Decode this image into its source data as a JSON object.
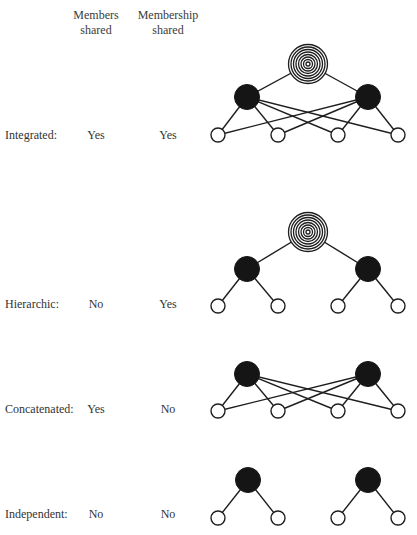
{
  "headers": {
    "members_shared": [
      "Members",
      "shared"
    ],
    "membership_shared": [
      "Membership",
      "shared"
    ]
  },
  "rows": [
    {
      "label": "Integrated:",
      "members_shared": "Yes",
      "membership_shared": "Yes"
    },
    {
      "label": "Hierarchic:",
      "members_shared": "No",
      "membership_shared": "Yes"
    },
    {
      "label": "Concatenated:",
      "members_shared": "Yes",
      "membership_shared": "No"
    },
    {
      "label": "Independent:",
      "members_shared": "No",
      "membership_shared": "No"
    }
  ],
  "diagrams": [
    {
      "name": "integrated",
      "has_top_node": true,
      "top_node": {
        "x": 308,
        "y": 64,
        "r": 20
      },
      "group_nodes": [
        {
          "x": 247,
          "y": 97
        },
        {
          "x": 368,
          "y": 97
        }
      ],
      "leaf_nodes": [
        {
          "x": 218,
          "y": 135
        },
        {
          "x": 278,
          "y": 135
        },
        {
          "x": 338,
          "y": 135
        },
        {
          "x": 398,
          "y": 135
        }
      ],
      "edges": "each group node connects to all four leaf nodes"
    },
    {
      "name": "hierarchic",
      "has_top_node": true,
      "top_node": {
        "x": 308,
        "y": 232,
        "r": 20
      },
      "group_nodes": [
        {
          "x": 247,
          "y": 269
        },
        {
          "x": 368,
          "y": 269
        }
      ],
      "leaf_nodes": [
        {
          "x": 218,
          "y": 306
        },
        {
          "x": 278,
          "y": 306
        },
        {
          "x": 338,
          "y": 306
        },
        {
          "x": 398,
          "y": 306
        }
      ],
      "edges": "each group node connects only to its own two leaf nodes"
    },
    {
      "name": "concatenated",
      "has_top_node": false,
      "group_nodes": [
        {
          "x": 247,
          "y": 374
        },
        {
          "x": 368,
          "y": 374
        }
      ],
      "leaf_nodes": [
        {
          "x": 218,
          "y": 411
        },
        {
          "x": 278,
          "y": 411
        },
        {
          "x": 338,
          "y": 411
        },
        {
          "x": 398,
          "y": 411
        }
      ],
      "edges": "each group node connects to all four leaf nodes"
    },
    {
      "name": "independent",
      "has_top_node": false,
      "group_nodes": [
        {
          "x": 248,
          "y": 480
        },
        {
          "x": 368,
          "y": 480
        }
      ],
      "leaf_nodes": [
        {
          "x": 218,
          "y": 518
        },
        {
          "x": 278,
          "y": 518
        },
        {
          "x": 338,
          "y": 518
        },
        {
          "x": 398,
          "y": 518
        }
      ],
      "edges": "each group node connects only to its own two leaf nodes"
    }
  ],
  "legend_semantics": {
    "concentric_node": "organization / superordinate unit",
    "black_node": "group",
    "white_node": "member"
  }
}
